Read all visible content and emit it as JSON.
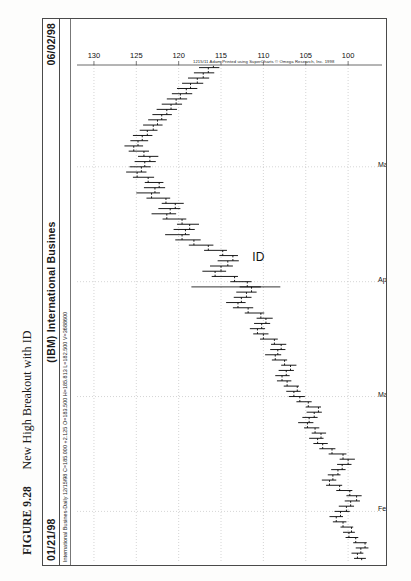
{
  "figure": {
    "number": "FIGURE 9.28",
    "title": "New High Breakout with ID"
  },
  "window": {
    "date_left": "01/21/98",
    "symbol_title": "(IBM) International Busines",
    "date_right": "06/02/98",
    "stats_line": "International Busines-Daily  12/15/98  C=185.000  +2.125  O=183.500  H=185.813  L=182.500  V=3688600"
  },
  "copyright": "1215/11 Adam Printed using SuperCharts © Omega Research, Inc. 1998",
  "annotation": {
    "label": "ID"
  },
  "chart_data": {
    "type": "bar",
    "chart_subtype": "ohlc-price-bars",
    "title": "(IBM) International Busines",
    "xlabel": "",
    "ylabel": "Price",
    "grid": true,
    "legend": "none",
    "orientation": "rotated-90-ccw",
    "ylim": [
      96,
      132
    ],
    "ytick_labels": [
      "130",
      "125",
      "120",
      "115",
      "110",
      "105",
      "100"
    ],
    "ytick_values": [
      130,
      125,
      120,
      115,
      110,
      105,
      100
    ],
    "xtick_labels": [
      "Feb",
      "Mar",
      "Apr",
      "May"
    ],
    "xtick_index": [
      9,
      31,
      53,
      75
    ],
    "quote": {
      "symbol": "International Busines-Daily",
      "date": "12/15/98",
      "close": "185.000",
      "change": "+2.125",
      "open": "183.500",
      "high": "185.813",
      "low": "182.500",
      "volume": "3688600"
    },
    "series": [
      {
        "name": "IBM daily OHLC",
        "fields": [
          "open",
          "high",
          "low",
          "close"
        ],
        "bars": [
          [
            98.4,
            99.3,
            97.9,
            98.9
          ],
          [
            98.9,
            99.6,
            98.2,
            98.5
          ],
          [
            98.5,
            99.1,
            97.6,
            98.0
          ],
          [
            98.0,
            99.4,
            97.8,
            99.1
          ],
          [
            99.1,
            100.3,
            98.8,
            99.9
          ],
          [
            99.9,
            100.6,
            99.2,
            99.6
          ],
          [
            99.6,
            100.9,
            99.4,
            100.6
          ],
          [
            100.6,
            101.8,
            100.2,
            101.4
          ],
          [
            101.4,
            102.2,
            100.6,
            100.9
          ],
          [
            100.9,
            101.6,
            99.8,
            100.2
          ],
          [
            100.2,
            101.1,
            99.3,
            99.7
          ],
          [
            99.7,
            100.4,
            98.6,
            99.0
          ],
          [
            99.0,
            100.2,
            98.4,
            99.8
          ],
          [
            99.8,
            101.4,
            99.5,
            101.0
          ],
          [
            101.0,
            102.6,
            100.7,
            102.2
          ],
          [
            102.2,
            103.1,
            101.4,
            101.8
          ],
          [
            101.8,
            102.4,
            100.9,
            101.2
          ],
          [
            101.2,
            102.0,
            100.3,
            100.7
          ],
          [
            100.7,
            101.3,
            99.6,
            100.0
          ],
          [
            100.0,
            101.0,
            99.2,
            100.6
          ],
          [
            100.6,
            102.3,
            100.2,
            101.9
          ],
          [
            101.9,
            103.4,
            101.5,
            103.0
          ],
          [
            103.0,
            104.1,
            102.4,
            103.6
          ],
          [
            103.6,
            104.6,
            102.9,
            103.2
          ],
          [
            103.2,
            104.3,
            102.6,
            103.9
          ],
          [
            103.9,
            105.2,
            103.4,
            104.8
          ],
          [
            104.8,
            105.9,
            104.1,
            104.6
          ],
          [
            104.6,
            105.4,
            103.6,
            104.0
          ],
          [
            104.0,
            104.9,
            103.1,
            103.5
          ],
          [
            103.5,
            105.0,
            103.2,
            104.7
          ],
          [
            104.7,
            106.1,
            104.3,
            105.7
          ],
          [
            105.7,
            107.0,
            105.1,
            106.4
          ],
          [
            106.4,
            107.3,
            105.6,
            106.0
          ],
          [
            106.0,
            107.6,
            105.8,
            107.2
          ],
          [
            107.2,
            108.4,
            106.7,
            107.8
          ],
          [
            107.8,
            108.6,
            106.9,
            107.3
          ],
          [
            107.3,
            108.2,
            106.4,
            106.8
          ],
          [
            106.8,
            107.9,
            106.1,
            107.5
          ],
          [
            107.5,
            109.0,
            107.2,
            108.6
          ],
          [
            108.6,
            109.8,
            107.9,
            108.3
          ],
          [
            108.3,
            109.2,
            107.4,
            107.9
          ],
          [
            107.9,
            109.1,
            107.3,
            108.7
          ],
          [
            108.7,
            110.4,
            108.3,
            110.0
          ],
          [
            110.0,
            111.2,
            109.4,
            110.7
          ],
          [
            110.7,
            111.6,
            109.8,
            110.2
          ],
          [
            110.2,
            111.1,
            109.2,
            109.7
          ],
          [
            109.7,
            110.8,
            108.9,
            110.3
          ],
          [
            110.3,
            112.2,
            109.9,
            111.8
          ],
          [
            111.8,
            113.6,
            111.2,
            113.0
          ],
          [
            113.0,
            114.4,
            112.1,
            112.6
          ],
          [
            112.6,
            113.5,
            111.4,
            112.0
          ],
          [
            112.0,
            113.2,
            110.8,
            111.4
          ],
          [
            111.4,
            112.8,
            110.3,
            111.9
          ],
          [
            111.9,
            113.9,
            111.4,
            113.4
          ],
          [
            113.4,
            116.1,
            113.0,
            115.7
          ],
          [
            115.7,
            117.2,
            114.4,
            115.0
          ],
          [
            115.0,
            116.3,
            113.6,
            114.2
          ],
          [
            114.2,
            115.4,
            112.9,
            113.6
          ],
          [
            113.6,
            115.2,
            113.0,
            114.8
          ],
          [
            114.8,
            117.0,
            114.3,
            116.5
          ],
          [
            116.5,
            118.8,
            115.9,
            118.2
          ],
          [
            118.2,
            120.4,
            117.4,
            119.6
          ],
          [
            119.6,
            121.6,
            118.7,
            119.2
          ],
          [
            119.2,
            120.6,
            118.1,
            118.7
          ],
          [
            118.7,
            120.2,
            117.6,
            119.6
          ],
          [
            119.6,
            121.9,
            119.1,
            121.4
          ],
          [
            121.4,
            123.2,
            120.3,
            121.0
          ],
          [
            121.0,
            122.4,
            119.8,
            120.4
          ],
          [
            120.4,
            122.0,
            119.4,
            121.5
          ],
          [
            121.5,
            123.8,
            121.0,
            123.2
          ],
          [
            123.2,
            125.0,
            122.2,
            122.8
          ],
          [
            122.8,
            124.1,
            121.6,
            122.3
          ],
          [
            122.3,
            124.0,
            121.8,
            123.6
          ],
          [
            123.6,
            125.4,
            122.9,
            124.9
          ],
          [
            124.9,
            126.2,
            123.8,
            124.4
          ],
          [
            124.4,
            125.8,
            123.3,
            124.0
          ],
          [
            124.0,
            125.2,
            122.7,
            123.4
          ],
          [
            123.4,
            124.8,
            122.4,
            124.1
          ],
          [
            124.1,
            125.9,
            123.5,
            125.3
          ],
          [
            125.3,
            126.4,
            124.2,
            124.8
          ],
          [
            124.8,
            125.7,
            123.6,
            124.3
          ],
          [
            124.3,
            125.4,
            123.1,
            123.7
          ],
          [
            123.7,
            124.6,
            122.5,
            123.0
          ],
          [
            123.0,
            124.2,
            121.9,
            122.5
          ],
          [
            122.5,
            123.6,
            121.4,
            122.0
          ],
          [
            122.0,
            123.1,
            120.8,
            121.4
          ],
          [
            121.4,
            122.6,
            120.2,
            120.9
          ],
          [
            120.9,
            122.0,
            119.6,
            120.3
          ],
          [
            120.3,
            121.4,
            119.0,
            119.8
          ],
          [
            119.8,
            120.8,
            118.4,
            119.1
          ],
          [
            119.1,
            120.2,
            117.8,
            118.6
          ],
          [
            118.6,
            119.6,
            117.1,
            117.8
          ],
          [
            117.8,
            118.9,
            116.4,
            117.1
          ],
          [
            117.1,
            118.2,
            115.8,
            116.5
          ],
          [
            116.5,
            117.6,
            115.2,
            115.9
          ]
        ]
      }
    ]
  }
}
